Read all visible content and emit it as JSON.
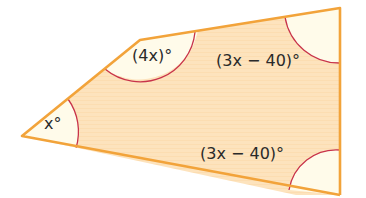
{
  "diagram": {
    "shape": "pentagon",
    "vertices": [
      [
        22,
        136
      ],
      [
        140,
        40
      ],
      [
        340,
        8
      ],
      [
        340,
        195
      ],
      [
        296,
        195
      ]
    ],
    "colors": {
      "fill": "#fde3bd",
      "stroke": "#f2a33a",
      "angle_fill": "#fffbea",
      "arc": "#c8334a",
      "text": "#2a2a2a"
    },
    "angles": [
      {
        "id": "left",
        "label": "x°"
      },
      {
        "id": "upper-left",
        "label": "(4x)°"
      },
      {
        "id": "top-right",
        "label": "(3x − 40)°"
      },
      {
        "id": "bottom-right",
        "label": "(3x − 40)°"
      }
    ]
  }
}
